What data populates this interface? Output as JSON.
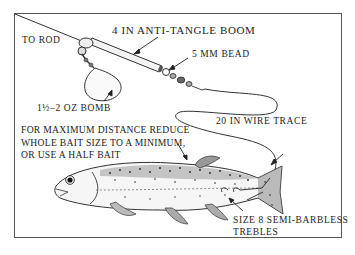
{
  "diagram": {
    "type": "fishing-rig-illustration",
    "labels": {
      "to_rod": "TO ROD",
      "boom": "4 IN ANTI-TANGLE BOOM",
      "bead": "5 MM BEAD",
      "bomb": "1½–2 OZ BOMB",
      "trace": "20 IN WIRE TRACE",
      "hooks_line1": "SIZE 8 SEMI-BARBLESS",
      "hooks_line2": "TREBLES"
    },
    "note": {
      "line1": "FOR MAXIMUM DISTANCE REDUCE",
      "line2": "WHOLE BAIT SIZE TO A MINIMUM,",
      "line3": "OR USE A HALF BAIT"
    },
    "components": [
      "main line",
      "anti-tangle boom",
      "bead",
      "swivel",
      "bomb weight",
      "wire trace",
      "treble hooks",
      "trout bait"
    ]
  }
}
